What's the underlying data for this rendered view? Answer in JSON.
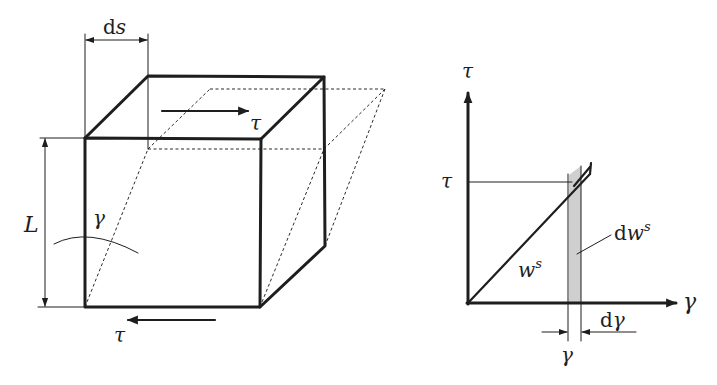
{
  "figure": {
    "left_panel": {
      "description": "Cube element under pure shear, original (solid) and sheared (dashed) configurations",
      "labels": {
        "ds": "ds",
        "ds_roman": "d",
        "ds_italic": "s",
        "length": "L",
        "angle": "γ",
        "top_stress": "τ",
        "bottom_stress": "τ"
      }
    },
    "right_panel": {
      "description": "Linear shear stress–strain diagram with strain energy density",
      "labels": {
        "y_axis": "τ",
        "x_axis": "γ",
        "tau_level": "τ",
        "area": "w",
        "area_sup": "s",
        "strip_d": "d",
        "strip_w": "w",
        "strip_sup": "s",
        "gamma_tick": "γ",
        "dgamma_d": "d",
        "dgamma_g": "γ"
      }
    }
  }
}
